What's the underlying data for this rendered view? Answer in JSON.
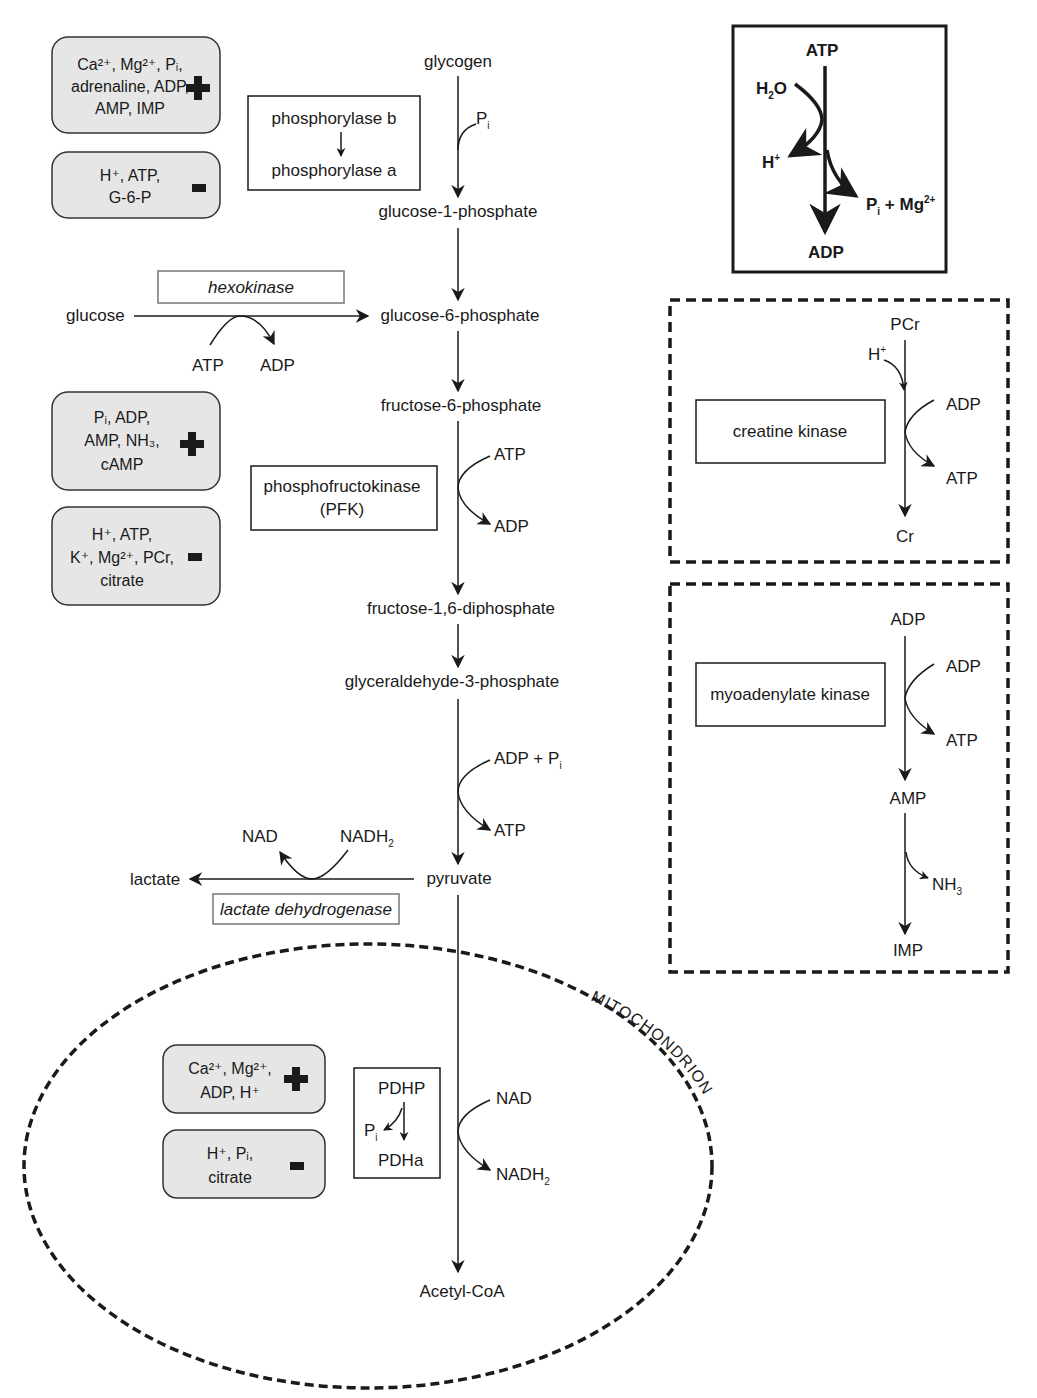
{
  "main_pathway": {
    "glycogen": "glycogen",
    "pi": "P",
    "pi_sub": "i",
    "g1p": "glucose-1-phosphate",
    "g6p": "glucose-6-phosphate",
    "f6p": "fructose-6-phosphate",
    "f16dp": "fructose-1,6-diphosphate",
    "g3p": "glyceraldehyde-3-phosphate",
    "pyruvate": "pyruvate",
    "acetylcoa": "Acetyl-CoA",
    "pfk_atp": "ATP",
    "pfk_adp": "ADP",
    "g3p_adp_pi": "ADP + P",
    "g3p_atp": "ATP",
    "pdh_nad": "NAD",
    "pdh_nadh": "NADH",
    "pdh_nadh_sub": "2"
  },
  "phosphorylase": {
    "from": "phosphorylase b",
    "to": "phosphorylase a",
    "activators": {
      "lines": [
        "Ca²⁺, Mg²⁺, Pᵢ,",
        "adrenaline, ADP,",
        "AMP, IMP"
      ],
      "sign": "+"
    },
    "inhibitors": {
      "lines": [
        "H⁺, ATP,",
        "G-6-P"
      ],
      "sign": "-"
    }
  },
  "hexokinase": {
    "label": "hexokinase",
    "substrate": "glucose",
    "atp": "ATP",
    "adp": "ADP"
  },
  "pfk": {
    "label_line1": "phosphofructokinase",
    "label_line2": "(PFK)",
    "activators": {
      "lines": [
        "Pᵢ, ADP,",
        "AMP, NH₃,",
        "cAMP"
      ],
      "sign": "+"
    },
    "inhibitors": {
      "lines": [
        "H⁺, ATP,",
        "K⁺, Mg²⁺, PCr,",
        "citrate"
      ],
      "sign": "-"
    }
  },
  "ldh": {
    "label": "lactate dehydrogenase",
    "product": "lactate",
    "nad": "NAD",
    "nadh": "NADH",
    "nadh_sub": "2"
  },
  "mitochondrion": {
    "label": "MITOCHONDRION",
    "activators": {
      "lines": [
        "Ca²⁺, Mg²⁺,",
        "ADP, H⁺"
      ],
      "sign": "+"
    },
    "inhibitors": {
      "lines": [
        "H⁺, Pᵢ,",
        "citrate"
      ],
      "sign": "-"
    },
    "pdh_box": {
      "from": "PDHP",
      "pi": "P",
      "pi_sub": "i",
      "to": "PDHa"
    }
  },
  "atp_hydrolysis": {
    "atp": "ATP",
    "water": "H",
    "water_sub": "2",
    "water_o": "O",
    "proton": "H",
    "proton_sup": "+",
    "products": "P",
    "products_sub": "i",
    "products_mg": " + Mg",
    "products_mg_sup": "2+",
    "adp": "ADP"
  },
  "creatine_kinase": {
    "label": "creatine kinase",
    "pcr": "PCr",
    "proton": "H",
    "proton_sup": "+",
    "adp": "ADP",
    "atp": "ATP",
    "cr": "Cr"
  },
  "myoadenylate_kinase": {
    "label": "myoadenylate kinase",
    "adp_top": "ADP",
    "adp_side": "ADP",
    "atp": "ATP",
    "amp": "AMP",
    "nh3": "NH",
    "nh3_sub": "3",
    "imp": "IMP"
  }
}
